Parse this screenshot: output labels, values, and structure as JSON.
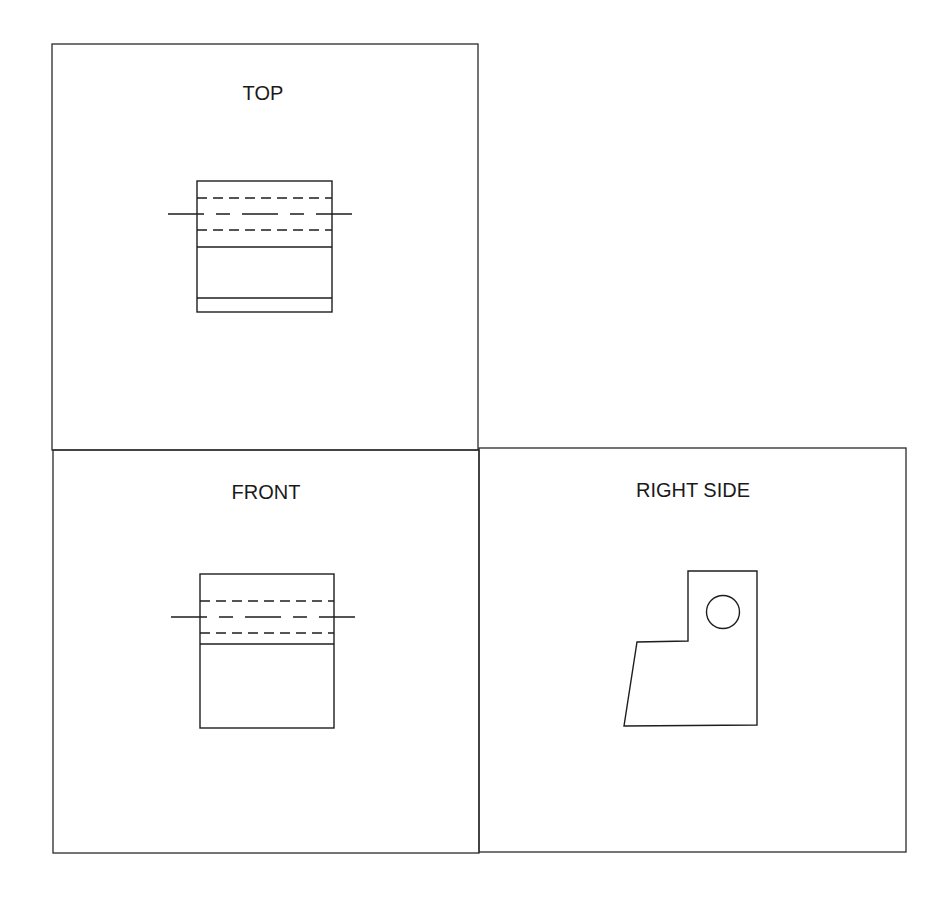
{
  "drawing": {
    "type": "orthographic projection",
    "views": [
      {
        "id": "top",
        "label": "TOP"
      },
      {
        "id": "front",
        "label": "FRONT"
      },
      {
        "id": "right",
        "label": "RIGHT SIDE"
      }
    ]
  },
  "labels": {
    "top": "TOP",
    "front": "FRONT",
    "right": "RIGHT SIDE"
  },
  "colors": {
    "line": "#1e1e1e",
    "background": "#ffffff"
  }
}
